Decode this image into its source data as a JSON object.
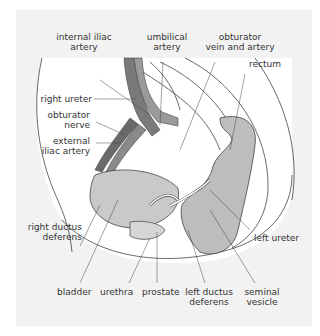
{
  "diagram": {
    "type": "anatomical illustration",
    "colors": {
      "background": "#f2f2f2",
      "organ_fill": "#c9c9c9",
      "vessel_dark": "#6e6e6e",
      "vessel_mid": "#9a9a9a",
      "line": "#444444"
    },
    "labels": {
      "internal_iliac_artery": [
        "internal iliac",
        "artery"
      ],
      "umbilical_artery": [
        "umbilical",
        "artery"
      ],
      "obturator_vein_artery": [
        "obturator",
        "vein and artery"
      ],
      "rectum": "rectum",
      "right_ureter": "right ureter",
      "obturator_nerve": [
        "obturator",
        "nerve"
      ],
      "external_iliac_artery": [
        "external",
        "iliac artery"
      ],
      "right_ductus_deferens": [
        "right ductus",
        "deferens"
      ],
      "left_ureter": "left ureter",
      "bladder": "bladder",
      "urethra": "urethra",
      "prostate": "prostate",
      "left_ductus_deferens": [
        "left ductus",
        "deferens"
      ],
      "seminal_vesicle": [
        "seminal",
        "vesicle"
      ]
    }
  }
}
